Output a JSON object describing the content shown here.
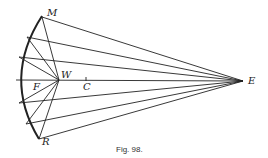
{
  "figure": {
    "caption": "Fig. 98.",
    "labels": {
      "M": "M",
      "R": "R",
      "W": "W",
      "F": "F",
      "C": "C",
      "E": "E"
    },
    "points": {
      "E": [
        243,
        81
      ],
      "W": [
        59,
        80
      ],
      "C": [
        86,
        81
      ],
      "mirror_arc_top": [
        42,
        16
      ],
      "mirror_arc_bottom": [
        39,
        139
      ],
      "mirror_arc_vertex": [
        15,
        80
      ]
    },
    "incident_ray_points_on_mirror": [
      [
        42,
        17
      ],
      [
        27,
        37
      ],
      [
        19,
        57
      ],
      [
        16,
        80
      ],
      [
        19,
        103
      ],
      [
        26,
        124
      ],
      [
        39,
        139
      ]
    ],
    "stroke_color": "#222222"
  }
}
